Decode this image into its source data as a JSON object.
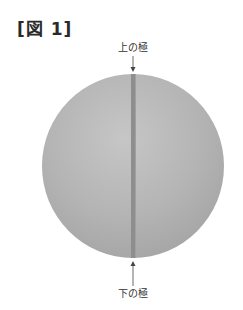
{
  "figure": {
    "title": "[図 1]",
    "labels": {
      "top_pole": "上の極",
      "bottom_pole": "下の極"
    },
    "colors": {
      "sphere_fill": "#b4b4b4",
      "sphere_highlight": "#c8c8c8",
      "sphere_shadow": "#a2a2a2",
      "stripe": "#8c8c8c",
      "arrow": "#444444"
    }
  }
}
